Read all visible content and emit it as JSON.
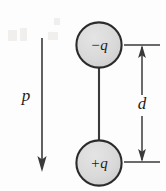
{
  "figure": {
    "background_color": "#fdfdfd",
    "stroke_color": "#2b2b2b",
    "charge_fill_color": "#d9d9d9"
  },
  "charges": [
    {
      "id": "negative-charge",
      "label": "−q",
      "sign": "negative",
      "cx": 99,
      "cy": 45,
      "r": 23
    },
    {
      "id": "positive-charge",
      "label": "+q",
      "sign": "positive",
      "cx": 99,
      "cy": 163,
      "r": 23
    }
  ],
  "rod": {
    "x": 99,
    "y_top": 68,
    "y_bottom": 140
  },
  "dipole_vector": {
    "label": "p",
    "label_x": 26,
    "label_y": 97,
    "x": 42,
    "y_start": 38,
    "y_end": 170,
    "direction": "down"
  },
  "dimension": {
    "label": "d",
    "label_x": 142,
    "label_y": 105,
    "arrow_x": 142,
    "y_top": 45,
    "y_bottom": 162,
    "extension_x_start": 124,
    "extension_x_end": 160
  }
}
